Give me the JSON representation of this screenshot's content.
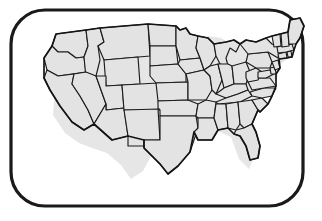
{
  "document": {
    "title": "United States Map Illustration",
    "kind": "line-art-map",
    "caption": ""
  },
  "frame": {
    "name": "rounded-rectangle-border",
    "stroke_color": "#1a1a1a",
    "fill_color": "#ffffff",
    "corner_radius": 34,
    "stroke_width": 3.2,
    "x": 11,
    "y": 10,
    "width": 292,
    "height": 196
  },
  "map": {
    "title": "Contiguous United States",
    "region": "lower-48",
    "fill_color": "#e3e3e3",
    "border_color": "#1c1c1c",
    "outline_color": "#141414",
    "shadow_color": "#d2d2d2",
    "includes_state_boundaries": true,
    "includes_labels": false,
    "state_count": 48,
    "states": [
      {
        "code": "WA",
        "name": "Washington"
      },
      {
        "code": "OR",
        "name": "Oregon"
      },
      {
        "code": "CA",
        "name": "California"
      },
      {
        "code": "ID",
        "name": "Idaho"
      },
      {
        "code": "NV",
        "name": "Nevada"
      },
      {
        "code": "MT",
        "name": "Montana"
      },
      {
        "code": "WY",
        "name": "Wyoming"
      },
      {
        "code": "UT",
        "name": "Utah"
      },
      {
        "code": "AZ",
        "name": "Arizona"
      },
      {
        "code": "CO",
        "name": "Colorado"
      },
      {
        "code": "NM",
        "name": "New Mexico"
      },
      {
        "code": "ND",
        "name": "North Dakota"
      },
      {
        "code": "SD",
        "name": "South Dakota"
      },
      {
        "code": "NE",
        "name": "Nebraska"
      },
      {
        "code": "KS",
        "name": "Kansas"
      },
      {
        "code": "OK",
        "name": "Oklahoma"
      },
      {
        "code": "TX",
        "name": "Texas"
      },
      {
        "code": "MN",
        "name": "Minnesota"
      },
      {
        "code": "IA",
        "name": "Iowa"
      },
      {
        "code": "MO",
        "name": "Missouri"
      },
      {
        "code": "AR",
        "name": "Arkansas"
      },
      {
        "code": "LA",
        "name": "Louisiana"
      },
      {
        "code": "WI",
        "name": "Wisconsin"
      },
      {
        "code": "IL",
        "name": "Illinois"
      },
      {
        "code": "MI",
        "name": "Michigan"
      },
      {
        "code": "IN",
        "name": "Indiana"
      },
      {
        "code": "OH",
        "name": "Ohio"
      },
      {
        "code": "KY",
        "name": "Kentucky"
      },
      {
        "code": "TN",
        "name": "Tennessee"
      },
      {
        "code": "MS",
        "name": "Mississippi"
      },
      {
        "code": "AL",
        "name": "Alabama"
      },
      {
        "code": "GA",
        "name": "Georgia"
      },
      {
        "code": "FL",
        "name": "Florida"
      },
      {
        "code": "SC",
        "name": "South Carolina"
      },
      {
        "code": "NC",
        "name": "North Carolina"
      },
      {
        "code": "VA",
        "name": "Virginia"
      },
      {
        "code": "WV",
        "name": "West Virginia"
      },
      {
        "code": "MD",
        "name": "Maryland"
      },
      {
        "code": "DE",
        "name": "Delaware"
      },
      {
        "code": "PA",
        "name": "Pennsylvania"
      },
      {
        "code": "NJ",
        "name": "New Jersey"
      },
      {
        "code": "NY",
        "name": "New York"
      },
      {
        "code": "CT",
        "name": "Connecticut"
      },
      {
        "code": "RI",
        "name": "Rhode Island"
      },
      {
        "code": "MA",
        "name": "Massachusetts"
      },
      {
        "code": "VT",
        "name": "Vermont"
      },
      {
        "code": "NH",
        "name": "New Hampshire"
      },
      {
        "code": "ME",
        "name": "Maine"
      }
    ]
  }
}
